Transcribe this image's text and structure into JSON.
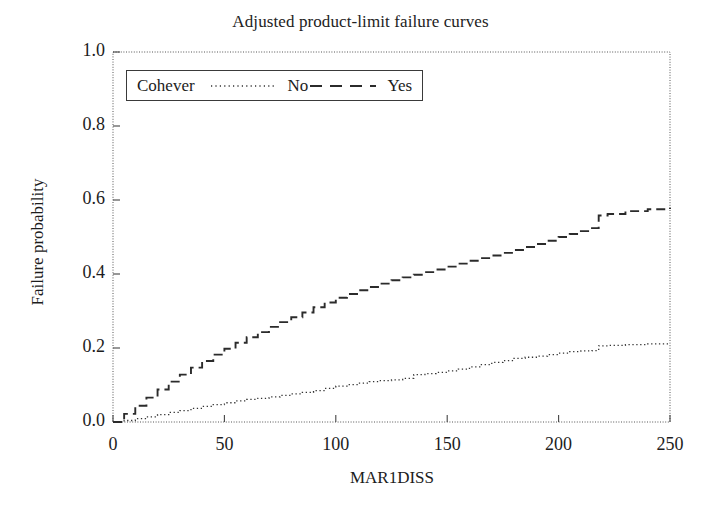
{
  "chart_data": {
    "type": "line",
    "title": "Adjusted product-limit failure curves",
    "xlabel": "MAR1DISS",
    "ylabel": "Failure probability",
    "xlim": [
      0,
      250
    ],
    "ylim": [
      0,
      1.0
    ],
    "xticks": [
      "0",
      "50",
      "100",
      "150",
      "200",
      "250"
    ],
    "xtick_values": [
      0,
      50,
      100,
      150,
      200,
      250
    ],
    "yticks": [
      "0.0",
      "0.2",
      "0.4",
      "0.6",
      "0.8",
      "1.0"
    ],
    "ytick_values": [
      0.0,
      0.2,
      0.4,
      0.6,
      0.8,
      1.0
    ],
    "grid": false,
    "legend_position": "upper-left-inside",
    "legend_title": "Cohever",
    "series": [
      {
        "name": "No",
        "style": "dotted",
        "color": "#333333",
        "x": [
          0,
          5,
          10,
          15,
          20,
          25,
          30,
          35,
          40,
          45,
          50,
          55,
          60,
          65,
          70,
          75,
          80,
          85,
          90,
          95,
          100,
          105,
          110,
          115,
          120,
          125,
          130,
          135,
          140,
          145,
          150,
          155,
          160,
          165,
          170,
          175,
          180,
          185,
          190,
          195,
          200,
          205,
          210,
          215,
          218,
          222,
          230,
          240,
          250
        ],
        "y": [
          0.0,
          0.004,
          0.009,
          0.014,
          0.02,
          0.026,
          0.031,
          0.037,
          0.042,
          0.047,
          0.052,
          0.057,
          0.061,
          0.064,
          0.068,
          0.072,
          0.076,
          0.08,
          0.085,
          0.091,
          0.097,
          0.101,
          0.105,
          0.109,
          0.112,
          0.114,
          0.118,
          0.128,
          0.131,
          0.134,
          0.138,
          0.143,
          0.149,
          0.155,
          0.161,
          0.166,
          0.172,
          0.175,
          0.178,
          0.182,
          0.186,
          0.19,
          0.192,
          0.193,
          0.206,
          0.207,
          0.209,
          0.211,
          0.213
        ]
      },
      {
        "name": "Yes",
        "style": "dashed",
        "color": "#2b2b2b",
        "x": [
          0,
          5,
          10,
          15,
          20,
          25,
          30,
          35,
          40,
          45,
          50,
          55,
          60,
          65,
          70,
          75,
          80,
          85,
          90,
          95,
          100,
          105,
          110,
          115,
          120,
          125,
          130,
          135,
          140,
          145,
          150,
          155,
          160,
          165,
          170,
          175,
          180,
          185,
          190,
          195,
          200,
          205,
          210,
          215,
          218,
          222,
          230,
          240,
          250
        ],
        "y": [
          0.0,
          0.022,
          0.044,
          0.066,
          0.088,
          0.109,
          0.128,
          0.147,
          0.165,
          0.182,
          0.198,
          0.214,
          0.229,
          0.243,
          0.257,
          0.27,
          0.283,
          0.296,
          0.31,
          0.323,
          0.336,
          0.346,
          0.356,
          0.365,
          0.374,
          0.383,
          0.391,
          0.398,
          0.405,
          0.412,
          0.42,
          0.428,
          0.436,
          0.443,
          0.45,
          0.457,
          0.465,
          0.473,
          0.481,
          0.49,
          0.5,
          0.508,
          0.516,
          0.524,
          0.558,
          0.562,
          0.57,
          0.575,
          0.579
        ]
      }
    ]
  },
  "legend": {
    "title": "Cohever",
    "entries": [
      {
        "label": "No",
        "style": "dotted"
      },
      {
        "label": "Yes",
        "style": "dashed"
      }
    ]
  }
}
